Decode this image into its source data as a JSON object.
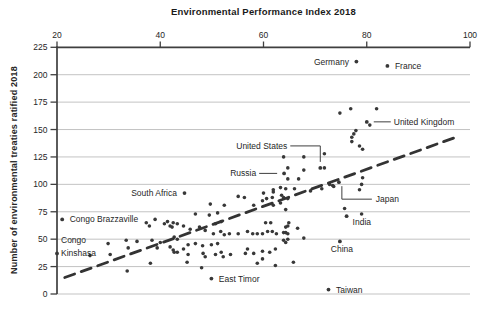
{
  "chart_data": {
    "type": "scatter",
    "title": "Environmental Performance Index 2018",
    "xlabel": "Environmental Performance Index 2018",
    "ylabel": "Number of environmental treaties ratified 2018",
    "xlim": [
      20,
      100
    ],
    "ylim": [
      0,
      225
    ],
    "x_ticks": [
      20,
      40,
      60,
      80,
      100
    ],
    "y_ticks": [
      0,
      25,
      50,
      75,
      100,
      125,
      150,
      175,
      200,
      225
    ],
    "x_axis_position": "top",
    "grid": "horizontal-light",
    "legend": "none",
    "colors": {
      "axis": "#3f3f3f",
      "grid": "#c3c3c3",
      "point": "#383838",
      "trend": "#333333",
      "text": "#262626",
      "background": "#ffffff"
    },
    "trend_line": {
      "style": "dashed",
      "x1": 21.5,
      "y1": 15,
      "x2": 97.3,
      "y2": 143
    },
    "labeled_points": [
      {
        "label": "Germany",
        "x": 78,
        "y": 212,
        "hint": "left"
      },
      {
        "label": "France",
        "x": 84,
        "y": 208,
        "hint": "right"
      },
      {
        "label": "United Kingdom",
        "x": 80,
        "y": 157,
        "hint": "line-right"
      },
      {
        "label": "United States",
        "x": 71,
        "y": 115,
        "hint": "elbow-above-left"
      },
      {
        "label": "Russia",
        "x": 64,
        "y": 110,
        "hint": "line-left"
      },
      {
        "label": "Japan",
        "x": 74.6,
        "y": 102,
        "hint": "elbow-below-right"
      },
      {
        "label": "India",
        "x": 76.1,
        "y": 71,
        "hint": "below-right"
      },
      {
        "label": "China",
        "x": 74.8,
        "y": 48,
        "hint": "below"
      },
      {
        "label": "Taiwan",
        "x": 72.6,
        "y": 4,
        "hint": "right"
      },
      {
        "label": "South Africa",
        "x": 44.7,
        "y": 92,
        "hint": "left"
      },
      {
        "label": "Congo Brazzaville",
        "x": 21,
        "y": 68,
        "hint": "right"
      },
      {
        "label": "Congo Kinshasa",
        "x": 20,
        "y": 37,
        "hint": "stack-right",
        "lines": [
          "Congo",
          "Kinshasa"
        ]
      },
      {
        "label": "East Timor",
        "x": 49.9,
        "y": 14,
        "hint": "right"
      }
    ],
    "points": [
      [
        74.8,
        165
      ],
      [
        76.9,
        169
      ],
      [
        81.9,
        169
      ],
      [
        80.6,
        154
      ],
      [
        77.9,
        149
      ],
      [
        77.5,
        146
      ],
      [
        77.1,
        143
      ],
      [
        77.1,
        139
      ],
      [
        78.6,
        135
      ],
      [
        79.2,
        132
      ],
      [
        63.9,
        125
      ],
      [
        67.8,
        125
      ],
      [
        71.8,
        128
      ],
      [
        64.7,
        115
      ],
      [
        71.8,
        115
      ],
      [
        67.8,
        113
      ],
      [
        66.8,
        105
      ],
      [
        64.7,
        105
      ],
      [
        61.9,
        95
      ],
      [
        63.3,
        97
      ],
      [
        61.7,
        88
      ],
      [
        60.6,
        87
      ],
      [
        59.8,
        85
      ],
      [
        63.5,
        90
      ],
      [
        63.9,
        88
      ],
      [
        72.8,
        100
      ],
      [
        73.6,
        98
      ],
      [
        79.2,
        106
      ],
      [
        79,
        100
      ],
      [
        78.6,
        95
      ],
      [
        64.3,
        96
      ],
      [
        66,
        96
      ],
      [
        69.1,
        94
      ],
      [
        71.3,
        96
      ],
      [
        73.4,
        99
      ],
      [
        75.7,
        78
      ],
      [
        79,
        73
      ],
      [
        64.3,
        77
      ],
      [
        64.9,
        65
      ],
      [
        66.6,
        60
      ],
      [
        64.3,
        61
      ],
      [
        64.3,
        56
      ],
      [
        67.8,
        51
      ],
      [
        65.8,
        29
      ],
      [
        64.3,
        47
      ],
      [
        49.7,
        82
      ],
      [
        52.4,
        81
      ],
      [
        55.1,
        89
      ],
      [
        58.1,
        81
      ],
      [
        56.3,
        88
      ],
      [
        60,
        92
      ],
      [
        61.9,
        93
      ],
      [
        64.7,
        87
      ],
      [
        61.9,
        81
      ],
      [
        63.3,
        83
      ],
      [
        46.8,
        73
      ],
      [
        49.5,
        72
      ],
      [
        51.1,
        74
      ],
      [
        51.8,
        66
      ],
      [
        50.7,
        64
      ],
      [
        44.5,
        62
      ],
      [
        43.3,
        64
      ],
      [
        42.5,
        65
      ],
      [
        41.9,
        62
      ],
      [
        45.8,
        59
      ],
      [
        47.6,
        61
      ],
      [
        48.7,
        58
      ],
      [
        50.3,
        55
      ],
      [
        51.7,
        57
      ],
      [
        52.4,
        54
      ],
      [
        53.4,
        55
      ],
      [
        55.1,
        55
      ],
      [
        56.9,
        57
      ],
      [
        57.9,
        55
      ],
      [
        58.8,
        55
      ],
      [
        59.8,
        55
      ],
      [
        60.8,
        57
      ],
      [
        61.7,
        57
      ],
      [
        62.5,
        55
      ],
      [
        63.9,
        56
      ],
      [
        64.7,
        55
      ],
      [
        43.3,
        50
      ],
      [
        45.4,
        45
      ],
      [
        46.8,
        46
      ],
      [
        48.2,
        44
      ],
      [
        49.9,
        45
      ],
      [
        51.1,
        46
      ],
      [
        44.5,
        41
      ],
      [
        43.3,
        38
      ],
      [
        42.5,
        40
      ],
      [
        45.4,
        36
      ],
      [
        48.7,
        34
      ],
      [
        50.7,
        36
      ],
      [
        52.2,
        34
      ],
      [
        53.6,
        36
      ],
      [
        45.2,
        29
      ],
      [
        48,
        24
      ],
      [
        56.9,
        41
      ],
      [
        58.1,
        37
      ],
      [
        59.8,
        39
      ],
      [
        61.2,
        38
      ],
      [
        62.3,
        41
      ],
      [
        58.8,
        28
      ],
      [
        62.3,
        26
      ],
      [
        64.7,
        62
      ],
      [
        63.9,
        49
      ],
      [
        64.7,
        50
      ],
      [
        61.4,
        65
      ],
      [
        60.4,
        65
      ],
      [
        51.8,
        38
      ],
      [
        56.5,
        37
      ],
      [
        59.8,
        32
      ],
      [
        48.3,
        37
      ],
      [
        37.3,
        65
      ],
      [
        37.9,
        62
      ],
      [
        39,
        68
      ],
      [
        40.8,
        64
      ],
      [
        41.4,
        66
      ],
      [
        42.3,
        61
      ],
      [
        42.7,
        52
      ],
      [
        33.4,
        49
      ],
      [
        35.5,
        48
      ],
      [
        29.9,
        46
      ],
      [
        33.8,
        42
      ],
      [
        38.4,
        49
      ],
      [
        40,
        47
      ],
      [
        30.3,
        36
      ],
      [
        26.4,
        35
      ],
      [
        33.6,
        21
      ],
      [
        38.1,
        28
      ],
      [
        39.4,
        42
      ],
      [
        41.9,
        43
      ],
      [
        42.7,
        38
      ]
    ]
  }
}
